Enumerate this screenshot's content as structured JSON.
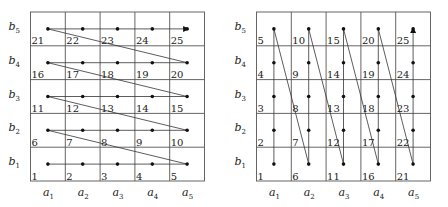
{
  "diagrams": [
    {
      "name": "row-major-ordering",
      "x_labels": [
        "a1",
        "a2",
        "a3",
        "a4",
        "a5"
      ],
      "y_labels": [
        "b1",
        "b2",
        "b3",
        "b4",
        "b5"
      ],
      "cell_numbers": [
        [
          "1",
          "2",
          "3",
          "4",
          "5"
        ],
        [
          "6",
          "7",
          "8",
          "9",
          "10"
        ],
        [
          "11",
          "12",
          "13",
          "14",
          "15"
        ],
        [
          "16",
          "17",
          "18",
          "19",
          "20"
        ],
        [
          "21",
          "22",
          "23",
          "24",
          "25"
        ]
      ],
      "traversal": "row-wise left-to-right, bottom-to-top, ending with arrow at (a5,b5)"
    },
    {
      "name": "column-major-ordering",
      "x_labels": [
        "a1",
        "a2",
        "a3",
        "a4",
        "a5"
      ],
      "y_labels": [
        "b1",
        "b2",
        "b3",
        "b4",
        "b5"
      ],
      "cell_numbers": [
        [
          "1",
          "6",
          "11",
          "16",
          "21"
        ],
        [
          "2",
          "7",
          "12",
          "17",
          "22"
        ],
        [
          "3",
          "8",
          "13",
          "18",
          "23"
        ],
        [
          "4",
          "9",
          "14",
          "19",
          "24"
        ],
        [
          "5",
          "10",
          "15",
          "20",
          "25"
        ]
      ],
      "traversal": "column-wise bottom-to-top, left-to-right, ending with arrow at (a5,b5)"
    }
  ]
}
